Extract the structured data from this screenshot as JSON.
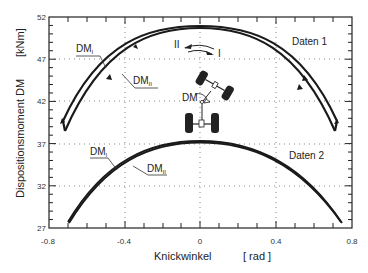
{
  "chart_data": {
    "type": "line",
    "title": "",
    "xlabel": "Knickwinkel",
    "xunit": "[ rad ]",
    "ylabel": "Dispositionsmoment DM",
    "yunit": "[kNm]",
    "xlim": [
      -0.8,
      0.8
    ],
    "ylim": [
      27,
      52
    ],
    "xticks": [
      "-0.8",
      "-0.4",
      "0",
      "0.4",
      "0.8"
    ],
    "yticks": [
      "27",
      "32",
      "37",
      "42",
      "47",
      "52"
    ],
    "grid": "dotted at labeled ticks",
    "x": [
      -0.73,
      -0.6,
      -0.4,
      -0.2,
      0.0,
      0.2,
      0.4,
      0.6,
      0.73
    ],
    "series": [
      {
        "name": "Daten 1 DM_I",
        "group": "Daten 1",
        "values": [
          39.7,
          43.3,
          47.6,
          50.0,
          50.9,
          50.3,
          47.9,
          43.6,
          39.6
        ]
      },
      {
        "name": "Daten 1 DM_II",
        "group": "Daten 1",
        "values": [
          38.5,
          42.4,
          46.9,
          49.6,
          50.7,
          49.9,
          47.3,
          42.6,
          38.3
        ]
      },
      {
        "name": "Daten 2 DM_I",
        "group": "Daten 2",
        "values": [
          27.8,
          31.0,
          34.5,
          36.6,
          37.3,
          36.7,
          34.4,
          30.9,
          27.7
        ]
      },
      {
        "name": "Daten 2 DM_II",
        "group": "Daten 2",
        "values": [
          27.7,
          30.8,
          34.3,
          36.5,
          37.2,
          36.6,
          34.3,
          30.8,
          27.6
        ]
      }
    ],
    "annotations": [
      "Daten 1",
      "Daten 2",
      "DM_I",
      "DM_II",
      "I",
      "II",
      "DM"
    ]
  },
  "labels": {
    "y_title": "Dispositionsmoment DM",
    "y_unit": "[kNm]",
    "x_title": "Knickwinkel",
    "x_unit": "[ rad ]",
    "data1": "Daten 1",
    "data2": "Daten 2",
    "dm": "DM",
    "dm_sub_i": "I",
    "dm_sub_ii": "II",
    "dir_i": "I",
    "dir_ii": "II",
    "vehicle_dm": "DM"
  },
  "ticks": {
    "x": [
      "-0.8",
      "-0.4",
      "0",
      "0.4",
      "0.8"
    ],
    "y": [
      "52",
      "47",
      "42",
      "37",
      "32",
      "27"
    ]
  }
}
